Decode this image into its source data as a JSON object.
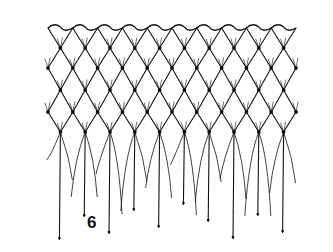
{
  "figure": {
    "label": "6",
    "ink_color": "#111111",
    "background": "#ffffff"
  },
  "net": {
    "left": 48,
    "right": 296,
    "top_edge_y": 28,
    "columns": 11,
    "knot_rows_y": [
      48,
      68,
      90,
      112,
      132
    ],
    "fringe_end_y_range": [
      160,
      240
    ]
  }
}
